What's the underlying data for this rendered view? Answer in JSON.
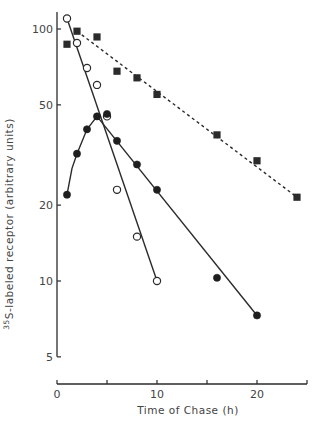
{
  "chart_data": {
    "type": "line",
    "title": "",
    "xlabel": "Time of Chase (h)",
    "ylabel": "35S-labeled receptor (arbitrary units)",
    "ylabel_superscript": "35",
    "ylabel_main": "S-labeled receptor (arbitrary units)",
    "yscale": "log",
    "xlim": [
      0,
      25
    ],
    "ylim": [
      5,
      120
    ],
    "x_ticks": [
      0,
      5,
      10,
      15,
      20,
      25
    ],
    "x_tick_labels": [
      "0",
      "",
      "10",
      "",
      "20",
      ""
    ],
    "y_ticks": [
      5,
      10,
      20,
      50,
      100
    ],
    "y_tick_labels": [
      "5",
      "10",
      "20",
      "50",
      "100"
    ],
    "grid": false,
    "legend": null,
    "series": [
      {
        "name": "open circles",
        "marker": "open-circle",
        "line": "solid",
        "points": [
          [
            1,
            110
          ],
          [
            2,
            88
          ],
          [
            3,
            70
          ],
          [
            4,
            60
          ],
          [
            5,
            45
          ],
          [
            6,
            23
          ],
          [
            8,
            15
          ],
          [
            10,
            10
          ]
        ],
        "fit_line": [
          [
            1,
            110
          ],
          [
            10,
            10
          ]
        ]
      },
      {
        "name": "filled circles",
        "marker": "filled-circle",
        "line": "solid",
        "points": [
          [
            1,
            22
          ],
          [
            2,
            32
          ],
          [
            3,
            40
          ],
          [
            4,
            45
          ],
          [
            5,
            46
          ],
          [
            6,
            36
          ],
          [
            8,
            29
          ],
          [
            10,
            23
          ],
          [
            16,
            10.3
          ],
          [
            20,
            7.3
          ]
        ],
        "fit_curve": [
          [
            1,
            22
          ],
          [
            1.5,
            28
          ],
          [
            2,
            32
          ],
          [
            3,
            40
          ],
          [
            4,
            45
          ]
        ],
        "fit_line": [
          [
            4,
            45
          ],
          [
            20,
            7.3
          ]
        ]
      },
      {
        "name": "filled squares",
        "marker": "filled-square",
        "line": "dashed",
        "points": [
          [
            1,
            87
          ],
          [
            2,
            98
          ],
          [
            4,
            93
          ],
          [
            6,
            68
          ],
          [
            8,
            64
          ],
          [
            10,
            55
          ],
          [
            16,
            38
          ],
          [
            20,
            30
          ],
          [
            24,
            21.5
          ]
        ],
        "fit_line": [
          [
            2,
            98
          ],
          [
            24,
            21.5
          ]
        ]
      }
    ]
  }
}
